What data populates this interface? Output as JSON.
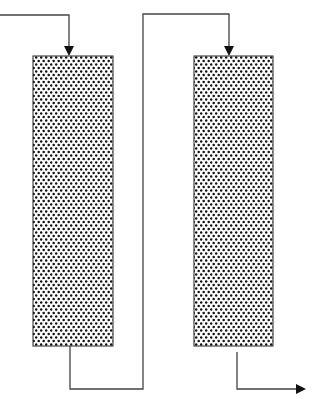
{
  "diagram": {
    "type": "two packed columns in series",
    "colors": {
      "line": "#444444",
      "packing_dot": "#111111",
      "background": "#ffffff"
    },
    "columns": [
      {
        "id": "column-1",
        "x": 33,
        "y": 56,
        "width": 80,
        "height": 290
      },
      {
        "id": "column-2",
        "x": 194,
        "y": 56,
        "width": 79,
        "height": 290
      }
    ],
    "streams": [
      {
        "id": "feed-inlet",
        "points": "0,15 69,15 69,50",
        "arrow": "down"
      },
      {
        "id": "interconnect",
        "points": "70,346 70,389 143,389 143,14 229,14 229,50",
        "arrow": "down"
      },
      {
        "id": "product-outlet",
        "points": "237,352 237,389 298,389",
        "arrow": "right"
      }
    ]
  }
}
